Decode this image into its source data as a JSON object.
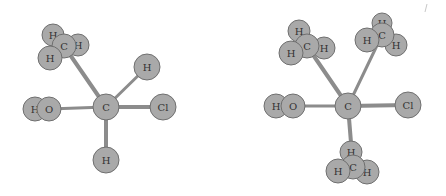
{
  "diagram": {
    "type": "molecular-structure-3d",
    "colors": {
      "atom_fill": "#a9a9a9",
      "atom_stroke": "#6f6f6f",
      "bond": "#8c8c8c",
      "label": "#333333",
      "background": "#ffffff"
    },
    "molecules": [
      {
        "id": "left",
        "atoms": [
          {
            "id": "C1",
            "label": "C",
            "x": 106,
            "y": 107,
            "r": 13
          },
          {
            "id": "Cm",
            "label": "C",
            "x": 64,
            "y": 46,
            "r": 12
          },
          {
            "id": "Hm1",
            "label": "H",
            "x": 53,
            "y": 35,
            "r": 11
          },
          {
            "id": "Hm2",
            "label": "H",
            "x": 78,
            "y": 45,
            "r": 11
          },
          {
            "id": "Hm3",
            "label": "H",
            "x": 50,
            "y": 58,
            "r": 12
          },
          {
            "id": "H1",
            "label": "H",
            "x": 147,
            "y": 67,
            "r": 13
          },
          {
            "id": "Cl",
            "label": "Cl",
            "x": 163,
            "y": 107,
            "r": 13
          },
          {
            "id": "O",
            "label": "O",
            "x": 49,
            "y": 109,
            "r": 12
          },
          {
            "id": "HO",
            "label": "H",
            "x": 35,
            "y": 109,
            "r": 12
          },
          {
            "id": "H2",
            "label": "H",
            "x": 106,
            "y": 160,
            "r": 13
          }
        ],
        "bonds": [
          {
            "from": "C1",
            "to": "Cm",
            "w": 4
          },
          {
            "from": "C1",
            "to": "H1",
            "w": 3
          },
          {
            "from": "C1",
            "to": "Cl",
            "w": 4
          },
          {
            "from": "C1",
            "to": "O",
            "w": 3
          },
          {
            "from": "C1",
            "to": "H2",
            "w": 4
          }
        ],
        "draw_order": [
          "Hm1",
          "Hm2",
          "Cm",
          "Hm3",
          "HO",
          "O",
          "H1",
          "Cl",
          "H2",
          "C1"
        ]
      },
      {
        "id": "right",
        "atoms": [
          {
            "id": "C1",
            "label": "C",
            "x": 348,
            "y": 106,
            "r": 13
          },
          {
            "id": "Ca",
            "label": "C",
            "x": 307,
            "y": 46,
            "r": 12
          },
          {
            "id": "Ha1",
            "label": "H",
            "x": 299,
            "y": 31,
            "r": 11
          },
          {
            "id": "Ha2",
            "label": "H",
            "x": 324,
            "y": 48,
            "r": 11
          },
          {
            "id": "Ha3",
            "label": "H",
            "x": 291,
            "y": 53,
            "r": 12
          },
          {
            "id": "Cb",
            "label": "C",
            "x": 382,
            "y": 35,
            "r": 12
          },
          {
            "id": "Hb1",
            "label": "H",
            "x": 382,
            "y": 23,
            "r": 10
          },
          {
            "id": "Hb2",
            "label": "H",
            "x": 367,
            "y": 40,
            "r": 12
          },
          {
            "id": "Hb3",
            "label": "H",
            "x": 396,
            "y": 45,
            "r": 11
          },
          {
            "id": "O",
            "label": "O",
            "x": 293,
            "y": 106,
            "r": 12
          },
          {
            "id": "HO",
            "label": "H",
            "x": 276,
            "y": 106,
            "r": 12
          },
          {
            "id": "Cl",
            "label": "Cl",
            "x": 408,
            "y": 105,
            "r": 13
          },
          {
            "id": "Cc",
            "label": "C",
            "x": 353,
            "y": 167,
            "r": 12
          },
          {
            "id": "Hc1",
            "label": "H",
            "x": 351,
            "y": 152,
            "r": 11
          },
          {
            "id": "Hc2",
            "label": "H",
            "x": 338,
            "y": 171,
            "r": 12
          },
          {
            "id": "Hc3",
            "label": "H",
            "x": 367,
            "y": 172,
            "r": 12
          }
        ],
        "bonds": [
          {
            "from": "C1",
            "to": "Ca",
            "w": 4
          },
          {
            "from": "C1",
            "to": "Cb",
            "w": 3
          },
          {
            "from": "C1",
            "to": "O",
            "w": 3
          },
          {
            "from": "C1",
            "to": "Cl",
            "w": 4
          },
          {
            "from": "C1",
            "to": "Cc",
            "w": 4
          }
        ],
        "draw_order": [
          "Ha1",
          "Ha2",
          "Ca",
          "Ha3",
          "Hb1",
          "Hb3",
          "Cb",
          "Hb2",
          "HO",
          "O",
          "Cl",
          "Hc1",
          "Hc3",
          "Cc",
          "Hc2",
          "C1"
        ]
      }
    ]
  }
}
